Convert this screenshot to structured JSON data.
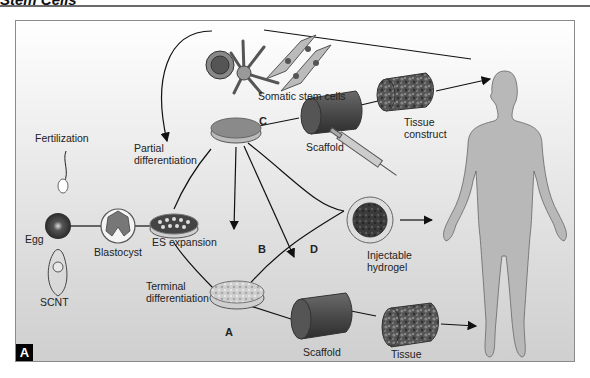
{
  "header": {
    "title": "Stem Cells"
  },
  "panel": {
    "badge": "A",
    "labels": {
      "fertilization": "Fertilization",
      "egg": "Egg",
      "scnt": "SCNT",
      "blastocyst": "Blastocyst",
      "es_expansion": "ES expansion",
      "partial_differentiation_1": "Partial",
      "partial_differentiation_2": "differentiation",
      "terminal_differentiation_1": "Terminal",
      "terminal_differentiation_2": "differentiation",
      "somatic_stem_cells": "Somatic stem cells",
      "scaffold_c": "Scaffold",
      "tissue_construct_c_1": "Tissue",
      "tissue_construct_c_2": "construct",
      "injectable_hydrogel_1": "Injectable",
      "injectable_hydrogel_2": "hydrogel",
      "scaffold_a": "Scaffold",
      "tissue_construct_a_1": "Tissue",
      "tissue_construct_a_2": "construct"
    },
    "paths": {
      "a": "A",
      "b": "B",
      "c": "C",
      "d": "D"
    }
  }
}
